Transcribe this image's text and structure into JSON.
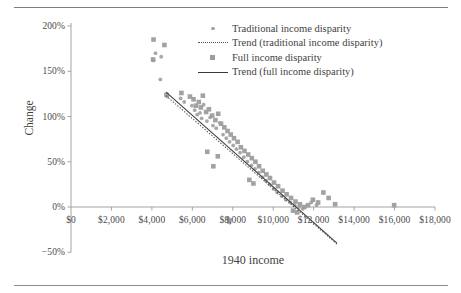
{
  "figure": {
    "has_top_rule": true,
    "has_bottom_rule": true
  },
  "legend": {
    "position": "upper-right-inside",
    "items": [
      {
        "key": "circle-marker",
        "label": "Traditional income disparity"
      },
      {
        "key": "dotted-line",
        "label": "Trend (traditional income disparity)"
      },
      {
        "key": "square-marker",
        "label": "Full income disparity"
      },
      {
        "key": "solid-line",
        "label": "Trend (full income disparity)"
      }
    ]
  },
  "colors": {
    "marker": "#9d9d9d",
    "marker_circle": "#a3a3a3",
    "trend_solid": "#3a3a3a",
    "trend_dotted": "#555555",
    "axis": "#9a9a9a",
    "text": "#3f3f3f",
    "rule": "#7d7d7d"
  },
  "chart_data": {
    "type": "scatter",
    "title": "",
    "xlabel": "1940 income",
    "ylabel": "Change",
    "xlim": [
      0,
      18000
    ],
    "ylim": [
      -0.5,
      2.0
    ],
    "grid": false,
    "xticks": [
      0,
      2000,
      4000,
      6000,
      8000,
      10000,
      12000,
      14000,
      16000,
      18000
    ],
    "xtick_labels": [
      "$0",
      "$2,000",
      "$4,000",
      "$6,000",
      "$8,000",
      "$10,000",
      "$12,000",
      "$14,000",
      "$16,000",
      "$18,000"
    ],
    "yticks": [
      -0.5,
      0,
      0.5,
      1.0,
      1.5,
      2.0
    ],
    "ytick_labels": [
      "−50%",
      "0%",
      "50%",
      "100%",
      "150%",
      "200%"
    ],
    "series": [
      {
        "name": "Traditional income disparity",
        "marker": "circle",
        "color": "#a3a3a3",
        "points": [
          [
            4180,
            1.7
          ],
          [
            4460,
            1.66
          ],
          [
            4080,
            1.62
          ],
          [
            4420,
            1.41
          ],
          [
            4760,
            1.22
          ],
          [
            5420,
            1.2
          ],
          [
            5600,
            1.16
          ],
          [
            5980,
            1.12
          ],
          [
            6120,
            1.07
          ],
          [
            6240,
            1.02
          ],
          [
            6380,
            1.04
          ],
          [
            6460,
            0.98
          ],
          [
            6560,
            1.13
          ],
          [
            6720,
            0.95
          ],
          [
            6880,
            0.99
          ],
          [
            7020,
            0.9
          ],
          [
            7180,
            0.87
          ],
          [
            7360,
            0.93
          ],
          [
            7520,
            0.8
          ],
          [
            7680,
            0.76
          ],
          [
            7840,
            0.72
          ],
          [
            8020,
            0.68
          ],
          [
            8180,
            0.64
          ],
          [
            8360,
            0.6
          ],
          [
            8540,
            0.55
          ],
          [
            8720,
            0.5
          ],
          [
            8920,
            0.46
          ],
          [
            9100,
            0.42
          ],
          [
            9280,
            0.38
          ],
          [
            9460,
            0.33
          ],
          [
            9640,
            0.29
          ],
          [
            9820,
            0.25
          ],
          [
            10020,
            0.2
          ],
          [
            10200,
            0.16
          ],
          [
            10420,
            0.12
          ],
          [
            10620,
            0.08
          ],
          [
            10840,
            0.05
          ],
          [
            11060,
            0.02
          ],
          [
            11280,
            0.0
          ],
          [
            11460,
            -0.02
          ],
          [
            7760,
            -0.12
          ],
          [
            7880,
            -0.14
          ],
          [
            11880,
            0.05
          ],
          [
            12140,
            0.02
          ]
        ]
      },
      {
        "name": "Full income disparity",
        "marker": "square",
        "color": "#9d9d9d",
        "points": [
          [
            4080,
            1.85
          ],
          [
            4620,
            1.79
          ],
          [
            4060,
            1.63
          ],
          [
            4720,
            1.24
          ],
          [
            5460,
            1.26
          ],
          [
            5880,
            1.22
          ],
          [
            6060,
            1.19
          ],
          [
            6180,
            1.12
          ],
          [
            6320,
            1.16
          ],
          [
            6420,
            1.1
          ],
          [
            6520,
            1.23
          ],
          [
            6680,
            1.05
          ],
          [
            6820,
            1.08
          ],
          [
            6980,
            1.01
          ],
          [
            7140,
            0.96
          ],
          [
            7280,
            1.03
          ],
          [
            7420,
            0.92
          ],
          [
            7580,
            0.88
          ],
          [
            7740,
            0.84
          ],
          [
            7900,
            0.8
          ],
          [
            8060,
            0.76
          ],
          [
            8240,
            0.72
          ],
          [
            8400,
            0.66
          ],
          [
            8580,
            0.62
          ],
          [
            8760,
            0.58
          ],
          [
            8940,
            0.54
          ],
          [
            9120,
            0.5
          ],
          [
            9300,
            0.45
          ],
          [
            9480,
            0.4
          ],
          [
            9660,
            0.36
          ],
          [
            9840,
            0.32
          ],
          [
            10040,
            0.27
          ],
          [
            10240,
            0.23
          ],
          [
            10460,
            0.18
          ],
          [
            10660,
            0.14
          ],
          [
            10880,
            0.1
          ],
          [
            11100,
            0.06
          ],
          [
            11320,
            0.03
          ],
          [
            11540,
            0.0
          ],
          [
            11720,
            0.02
          ],
          [
            11960,
            0.08
          ],
          [
            12220,
            0.05
          ],
          [
            12480,
            0.16
          ],
          [
            12740,
            0.1
          ],
          [
            13060,
            0.03
          ],
          [
            15980,
            0.02
          ],
          [
            6740,
            0.61
          ],
          [
            7260,
            0.56
          ],
          [
            8820,
            0.3
          ],
          [
            9020,
            0.26
          ],
          [
            7040,
            0.45
          ],
          [
            10980,
            -0.04
          ],
          [
            11180,
            -0.06
          ],
          [
            7820,
            -0.16
          ]
        ]
      }
    ],
    "trendlines": [
      {
        "name": "Trend (traditional income disparity)",
        "style": "dotted",
        "color": "#555555",
        "x_start": 4700,
        "y_start": 1.23,
        "x_end": 13150,
        "y_end": -0.41
      },
      {
        "name": "Trend (full income disparity)",
        "style": "solid",
        "color": "#3a3a3a",
        "x_start": 4700,
        "y_start": 1.27,
        "x_end": 13150,
        "y_end": -0.4
      }
    ]
  }
}
